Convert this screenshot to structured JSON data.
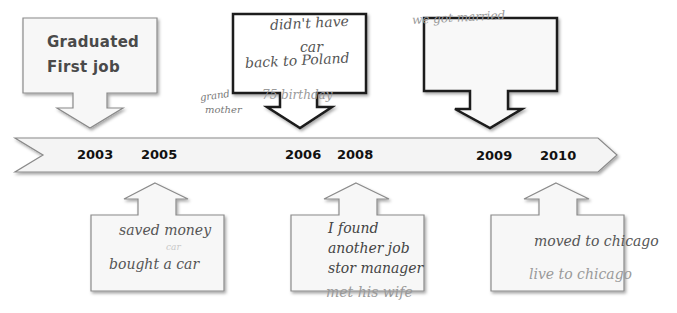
{
  "timeline": {
    "years": [
      "2003",
      "2005",
      "2006",
      "2008",
      "2009",
      "2010"
    ],
    "colors": {
      "banner_fill": "#f4f4f4",
      "banner_stroke": "#8a8a8a",
      "callout_fill": "#f7f7f7",
      "callout_stroke_light": "#7a7a7a",
      "callout_stroke_dark": "#1a1a1a"
    }
  },
  "callouts_top": [
    {
      "position": "2003",
      "lines": [
        "Graduated",
        "First job"
      ]
    },
    {
      "position": "2006",
      "lines": [
        "didn't have",
        "car",
        "back to Poland",
        "75 birthday"
      ],
      "side_note": [
        "grand",
        "mother"
      ]
    },
    {
      "position": "2009",
      "lines": [
        "we got married"
      ]
    }
  ],
  "callouts_bottom": [
    {
      "position": "2005",
      "lines": [
        "saved money",
        "car",
        "bought a car"
      ]
    },
    {
      "position": "2008",
      "lines": [
        "I found",
        "another job",
        "stor manager",
        "met his wife"
      ]
    },
    {
      "position": "2010",
      "lines": [
        "moved to chicago",
        "live to chicago"
      ]
    }
  ]
}
